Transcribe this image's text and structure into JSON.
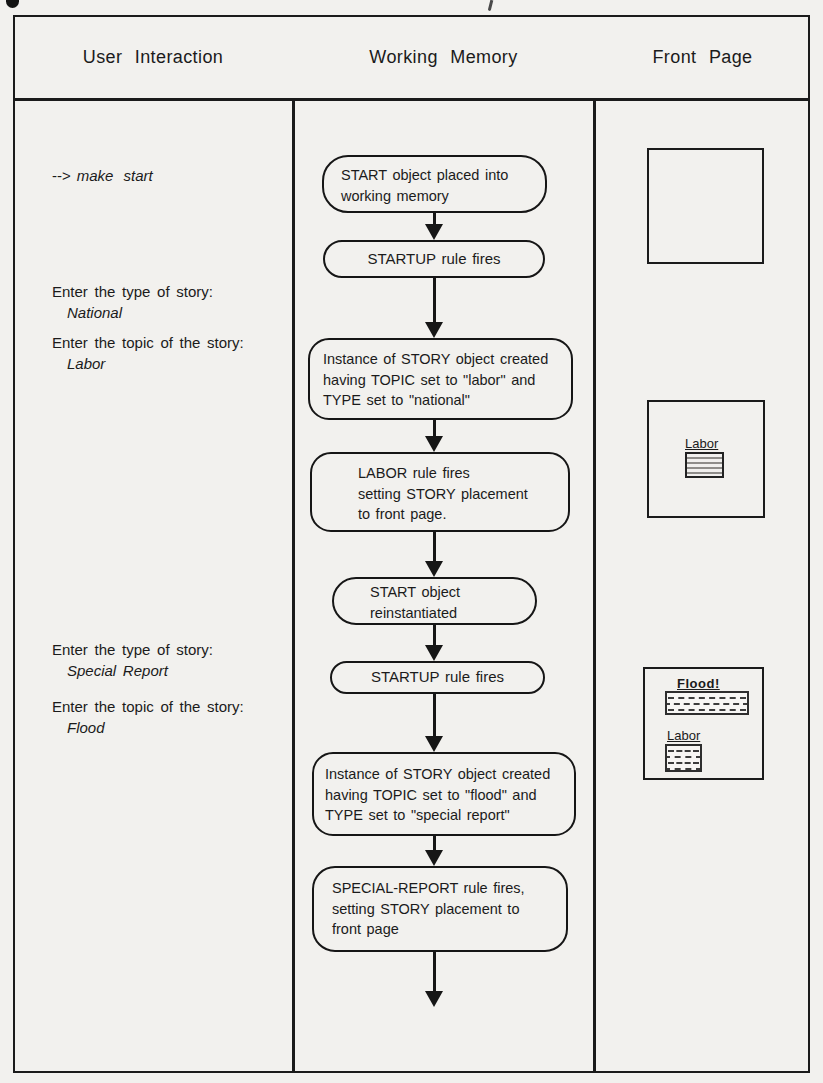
{
  "colors": {
    "ink": "#1b1b1b",
    "paper": "#f2f1ee"
  },
  "columns": {
    "user_interaction": "User Interaction",
    "working_memory": "Working Memory",
    "front_page": "Front Page"
  },
  "user_interaction": {
    "command_prefix": "-->",
    "command": "make start",
    "prompts": [
      {
        "prompt": "Enter the type of story:",
        "response": "National"
      },
      {
        "prompt": "Enter the topic of the story:",
        "response": "Labor"
      },
      {
        "prompt": "Enter the type of story:",
        "response": "Special Report"
      },
      {
        "prompt": "Enter the topic of the story:",
        "response": "Flood"
      }
    ]
  },
  "working_memory": {
    "nodes": [
      {
        "lines": [
          "START object placed into",
          "working memory"
        ]
      },
      {
        "lines": [
          "STARTUP rule fires"
        ]
      },
      {
        "lines": [
          "Instance of STORY object created",
          "having TOPIC set to \"labor\" and",
          "TYPE set to \"national\""
        ]
      },
      {
        "lines": [
          "LABOR rule fires",
          "setting STORY placement",
          "to front page."
        ]
      },
      {
        "lines": [
          "START object",
          "reinstantiated"
        ]
      },
      {
        "lines": [
          "STARTUP rule fires"
        ]
      },
      {
        "lines": [
          "Instance of STORY object created",
          "having TOPIC set to \"flood\" and",
          "TYPE set to \"special report\""
        ]
      },
      {
        "lines": [
          "SPECIAL-REPORT rule fires,",
          "setting STORY placement to",
          "front page"
        ]
      }
    ]
  },
  "front_page": {
    "panels": [
      {
        "stories": []
      },
      {
        "stories": [
          {
            "label": "Labor",
            "texture": "striped"
          }
        ]
      },
      {
        "stories": [
          {
            "label": "Flood!",
            "texture": "dotted"
          },
          {
            "label": "Labor",
            "texture": "dotted"
          }
        ]
      }
    ]
  }
}
